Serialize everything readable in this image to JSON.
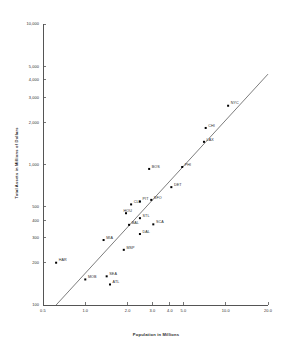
{
  "chart_data": {
    "type": "scatter",
    "title": "",
    "xlabel": "Population in Millions",
    "ylabel": "Total Assets in Millions of Dollars",
    "xscale": "log",
    "yscale": "log",
    "xlim": [
      0.5,
      20.0
    ],
    "ylim": [
      100,
      10000
    ],
    "grid": false,
    "legend": false,
    "xticks": [
      "0.5",
      "1.0",
      "2.0",
      "3.0",
      "4.0",
      "5.0",
      "10.0",
      "20.0"
    ],
    "xtick_values": [
      0.5,
      1.0,
      2.0,
      3.0,
      4.0,
      5.0,
      10.0,
      20.0
    ],
    "yticks": [
      "100",
      "200",
      "300",
      "400",
      "500",
      "1,000",
      "2,000",
      "3,000",
      "4,000",
      "5,000",
      "10,000"
    ],
    "ytick_values": [
      100,
      200,
      300,
      400,
      500,
      1000,
      2000,
      3000,
      4000,
      5000,
      10000
    ],
    "trendline": {
      "label": "",
      "x_start": 0.62,
      "y_start": 100,
      "x_end": 20.0,
      "y_end": 4400
    },
    "points": [
      {
        "label": "HAR",
        "x": 0.62,
        "y": 200,
        "label_position": "right"
      },
      {
        "label": "MOB",
        "x": 1.0,
        "y": 152,
        "label_position": "right"
      },
      {
        "label": "SEA",
        "x": 1.42,
        "y": 160,
        "label_position": "right"
      },
      {
        "label": "ATL",
        "x": 1.5,
        "y": 140,
        "label_position": "right"
      },
      {
        "label": "MIA",
        "x": 1.35,
        "y": 290,
        "label_position": "right"
      },
      {
        "label": "MSP",
        "x": 1.88,
        "y": 247,
        "label_position": "right"
      },
      {
        "label": "BAL",
        "x": 2.05,
        "y": 372,
        "label_position": "right"
      },
      {
        "label": "HOU",
        "x": 1.95,
        "y": 450,
        "label_position": "left"
      },
      {
        "label": "CLE",
        "x": 2.12,
        "y": 520,
        "label_position": "right"
      },
      {
        "label": "PIT",
        "x": 2.45,
        "y": 545,
        "label_position": "right"
      },
      {
        "label": "STL",
        "x": 2.45,
        "y": 415,
        "label_position": "right"
      },
      {
        "label": "DAL",
        "x": 2.45,
        "y": 320,
        "label_position": "right"
      },
      {
        "label": "SCA",
        "x": 3.05,
        "y": 375,
        "label_position": "right"
      },
      {
        "label": "SFO",
        "x": 2.95,
        "y": 560,
        "label_position": "right"
      },
      {
        "label": "BOS",
        "x": 2.85,
        "y": 930,
        "label_position": "right"
      },
      {
        "label": "DET",
        "x": 4.1,
        "y": 690,
        "label_position": "right"
      },
      {
        "label": "PHI",
        "x": 4.9,
        "y": 960,
        "label_position": "right"
      },
      {
        "label": "LAX",
        "x": 7.0,
        "y": 1450,
        "label_position": "right"
      },
      {
        "label": "CHI",
        "x": 7.2,
        "y": 1820,
        "label_position": "right"
      },
      {
        "label": "NYC",
        "x": 10.4,
        "y": 2620,
        "label_position": "right"
      }
    ]
  }
}
